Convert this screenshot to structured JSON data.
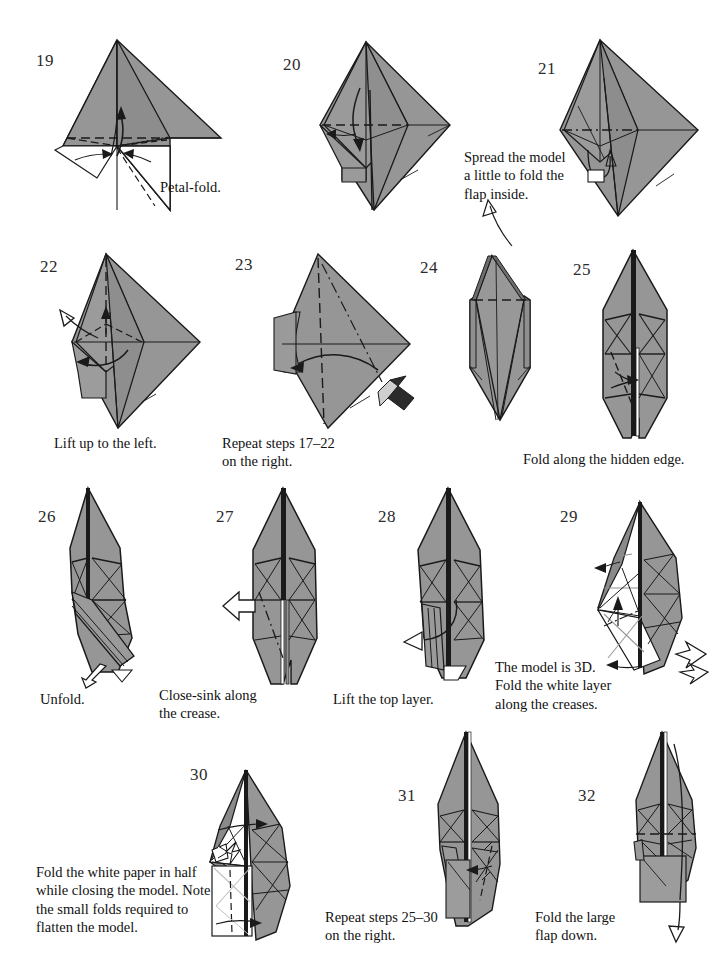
{
  "page": {
    "width": 717,
    "height": 970,
    "background": "#ffffff",
    "paper_gray": "#969696",
    "paper_gray_dark": "#7d7d7d",
    "paper_white": "#ffffff",
    "ink": "#1a1a1a"
  },
  "steps": [
    {
      "number": "19",
      "caption": "Petal-fold.",
      "num_pos": [
        36,
        52
      ],
      "caption_pos": [
        160,
        178
      ]
    },
    {
      "number": "20",
      "caption": "",
      "num_pos": [
        283,
        56
      ],
      "caption_pos": [
        0,
        0
      ]
    },
    {
      "number": "21",
      "caption": "Spread the model\na little to fold the\nflap inside.",
      "num_pos": [
        538,
        60
      ],
      "caption_pos": [
        464,
        148
      ]
    },
    {
      "number": "22",
      "caption": "Lift up to the left.",
      "num_pos": [
        40,
        258
      ],
      "caption_pos": [
        54,
        434
      ]
    },
    {
      "number": "23",
      "caption": "Repeat steps 17–22\non the right.",
      "num_pos": [
        235,
        256
      ],
      "caption_pos": [
        222,
        434
      ]
    },
    {
      "number": "24",
      "caption": "",
      "num_pos": [
        420,
        259
      ],
      "caption_pos": [
        0,
        0
      ]
    },
    {
      "number": "25",
      "caption": "Fold along the hidden edge.",
      "num_pos": [
        573,
        261
      ],
      "caption_pos": [
        523,
        450
      ]
    },
    {
      "number": "26",
      "caption": "Unfold.",
      "num_pos": [
        38,
        508
      ],
      "caption_pos": [
        40,
        690
      ]
    },
    {
      "number": "27",
      "caption": "Close-sink along\nthe crease.",
      "num_pos": [
        216,
        508
      ],
      "caption_pos": [
        159,
        686
      ]
    },
    {
      "number": "28",
      "caption": "Lift the top layer.",
      "num_pos": [
        378,
        508
      ],
      "caption_pos": [
        333,
        690
      ]
    },
    {
      "number": "29",
      "caption": "The model is 3D.\nFold the white layer\nalong the creases.",
      "num_pos": [
        560,
        508
      ],
      "caption_pos": [
        495,
        658
      ]
    },
    {
      "number": "30",
      "caption": "Fold the white paper in half\nwhile closing the model. Note\nthe small folds required to\nflatten the model.",
      "num_pos": [
        190,
        766
      ],
      "caption_pos": [
        36,
        863
      ]
    },
    {
      "number": "31",
      "caption": "Repeat steps 25–30\non the right.",
      "num_pos": [
        398,
        787
      ],
      "caption_pos": [
        325,
        908
      ]
    },
    {
      "number": "32",
      "caption": "Fold the large\nflap down.",
      "num_pos": [
        578,
        787
      ],
      "caption_pos": [
        535,
        908
      ]
    }
  ]
}
